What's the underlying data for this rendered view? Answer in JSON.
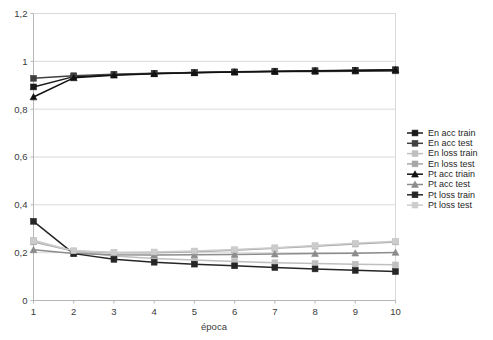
{
  "chart_data": {
    "type": "line",
    "title": "",
    "xlabel": "época",
    "ylabel": "",
    "x": [
      1,
      2,
      3,
      4,
      5,
      6,
      7,
      8,
      9,
      10
    ],
    "xtick_labels": [
      "1",
      "2",
      "3",
      "4",
      "5",
      "6",
      "7",
      "8",
      "9",
      "10"
    ],
    "ytick_labels": [
      "0",
      "0,2",
      "0,4",
      "0,6",
      "0,8",
      "1",
      "1,2"
    ],
    "ytick_values": [
      0,
      0.2,
      0.4,
      0.6,
      0.8,
      1.0,
      1.2
    ],
    "xlim": [
      1,
      10
    ],
    "ylim": [
      0,
      1.2
    ],
    "grid": "horizontal",
    "legend_position": "right",
    "decimal_separator": ",",
    "series": [
      {
        "name": "En acc train",
        "marker": "square",
        "color": "#1a1a1a",
        "values": [
          0.893,
          0.936,
          0.944,
          0.949,
          0.953,
          0.956,
          0.959,
          0.961,
          0.963,
          0.965
        ]
      },
      {
        "name": "En acc test",
        "marker": "square",
        "color": "#404040",
        "values": [
          0.929,
          0.94,
          0.946,
          0.95,
          0.953,
          0.955,
          0.957,
          0.958,
          0.959,
          0.96
        ]
      },
      {
        "name": "En loss train",
        "marker": "square",
        "color": "#bfbfbf",
        "values": [
          0.252,
          0.205,
          0.186,
          0.176,
          0.169,
          0.163,
          0.158,
          0.155,
          0.152,
          0.149
        ]
      },
      {
        "name": "En loss test",
        "marker": "square",
        "color": "#a6a6a6",
        "values": [
          0.245,
          0.207,
          0.2,
          0.2,
          0.204,
          0.21,
          0.218,
          0.227,
          0.236,
          0.245
        ]
      },
      {
        "name": "Pt acc triain",
        "marker": "triangle",
        "color": "#111111",
        "values": [
          0.851,
          0.931,
          0.942,
          0.948,
          0.952,
          0.955,
          0.958,
          0.96,
          0.962,
          0.964
        ]
      },
      {
        "name": "Pt acc test",
        "marker": "triangle",
        "color": "#8c8c8c",
        "values": [
          0.212,
          0.196,
          0.191,
          0.19,
          0.191,
          0.192,
          0.194,
          0.196,
          0.198,
          0.201
        ]
      },
      {
        "name": "Pt loss train",
        "marker": "square",
        "color": "#262626",
        "values": [
          0.331,
          0.196,
          0.172,
          0.16,
          0.152,
          0.145,
          0.138,
          0.132,
          0.126,
          0.121
        ]
      },
      {
        "name": "Pt loss test",
        "marker": "square",
        "color": "#cccccc",
        "values": [
          0.249,
          0.208,
          0.202,
          0.203,
          0.207,
          0.213,
          0.221,
          0.23,
          0.239,
          0.248
        ]
      }
    ],
    "legend": [
      "En acc train",
      "En acc test",
      "En loss train",
      "En loss test",
      "Pt acc triain",
      "Pt acc test",
      "Pt loss train",
      "Pt loss test"
    ]
  },
  "colors": {
    "background": "#ffffff",
    "gridline": "#d9d9d9",
    "axis": "#b6b6b6",
    "text": "#3a3a3a"
  }
}
